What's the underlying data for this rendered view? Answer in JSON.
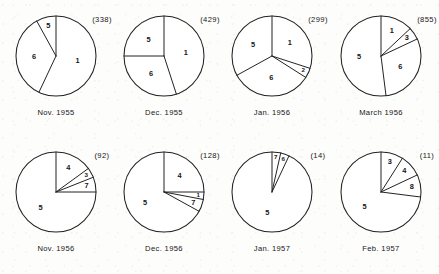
{
  "figure": {
    "name": "monthly-composition-pie-series",
    "background": "#fdfdfc",
    "stroke_color": "#232323",
    "rows": 2,
    "columns": 4
  },
  "chart_data": {
    "type": "pie",
    "title": "",
    "subtitle": "",
    "xlabel": "",
    "ylabel": "",
    "legend_position": "none",
    "grid": false,
    "note": "Eight pie charts; each wedge is annotated with a category number, each pie annotated with a parenthesised total count and a month caption.",
    "charts": [
      {
        "caption": "Nov. 1955",
        "total_label": "(338)",
        "total": 338,
        "categories": [
          "1",
          "5",
          "6"
        ],
        "values": [
          57,
          8,
          35
        ],
        "slices": [
          {
            "label": "1",
            "percent": 57,
            "start_deg": 0,
            "end_deg": 205.2
          },
          {
            "label": "6",
            "percent": 35,
            "start_deg": 205.2,
            "end_deg": 331.2
          },
          {
            "label": "5",
            "percent": 8,
            "start_deg": 331.2,
            "end_deg": 360
          }
        ]
      },
      {
        "caption": "Dec. 1955",
        "total_label": "(429)",
        "total": 429,
        "categories": [
          "1",
          "5",
          "6"
        ],
        "values": [
          45,
          25,
          30
        ],
        "slices": [
          {
            "label": "1",
            "percent": 45,
            "start_deg": 0,
            "end_deg": 162
          },
          {
            "label": "6",
            "percent": 30,
            "start_deg": 162,
            "end_deg": 270
          },
          {
            "label": "5",
            "percent": 25,
            "start_deg": 270,
            "end_deg": 360
          }
        ]
      },
      {
        "caption": "Jan. 1956",
        "total_label": "(299)",
        "total": 299,
        "categories": [
          "1",
          "2",
          "5",
          "6"
        ],
        "values": [
          30,
          4,
          33,
          33
        ],
        "slices": [
          {
            "label": "1",
            "percent": 30,
            "start_deg": 0,
            "end_deg": 108
          },
          {
            "label": "2",
            "percent": 4,
            "start_deg": 108,
            "end_deg": 122.4
          },
          {
            "label": "6",
            "percent": 33,
            "start_deg": 122.4,
            "end_deg": 241.2
          },
          {
            "label": "5",
            "percent": 33,
            "start_deg": 241.2,
            "end_deg": 360
          }
        ]
      },
      {
        "caption": "March 1956",
        "total_label": "(855)",
        "total": 855,
        "categories": [
          "1",
          "3",
          "5",
          "6"
        ],
        "values": [
          13,
          5,
          52,
          30
        ],
        "slices": [
          {
            "label": "1",
            "percent": 13,
            "start_deg": 0,
            "end_deg": 46.8
          },
          {
            "label": "3",
            "percent": 5,
            "start_deg": 46.8,
            "end_deg": 64.8
          },
          {
            "label": "6",
            "percent": 30,
            "start_deg": 64.8,
            "end_deg": 172.8
          },
          {
            "label": "5",
            "percent": 52,
            "start_deg": 172.8,
            "end_deg": 360
          }
        ]
      },
      {
        "caption": "Nov. 1956",
        "total_label": "(92)",
        "total": 92,
        "categories": [
          "3",
          "4",
          "5",
          "7"
        ],
        "values": [
          4,
          15,
          75,
          6
        ],
        "slices": [
          {
            "label": "4",
            "percent": 15,
            "start_deg": 0,
            "end_deg": 54
          },
          {
            "label": "3",
            "percent": 4,
            "start_deg": 54,
            "end_deg": 68.4
          },
          {
            "label": "7",
            "percent": 6,
            "start_deg": 68.4,
            "end_deg": 90
          },
          {
            "label": "5",
            "percent": 75,
            "start_deg": 90,
            "end_deg": 360
          }
        ]
      },
      {
        "caption": "Dec. 1956",
        "total_label": "(128)",
        "total": 128,
        "categories": [
          "1",
          "4",
          "5",
          "7"
        ],
        "values": [
          3,
          25,
          67,
          5
        ],
        "slices": [
          {
            "label": "4",
            "percent": 25,
            "start_deg": 0,
            "end_deg": 90
          },
          {
            "label": "1",
            "percent": 3,
            "start_deg": 90,
            "end_deg": 100.8
          },
          {
            "label": "7",
            "percent": 5,
            "start_deg": 100.8,
            "end_deg": 118.8
          },
          {
            "label": "5",
            "percent": 67,
            "start_deg": 118.8,
            "end_deg": 360
          }
        ]
      },
      {
        "caption": "Jan. 1957",
        "total_label": "(14)",
        "total": 14,
        "categories": [
          "5",
          "6",
          "7"
        ],
        "values": [
          93,
          3.5,
          3.5
        ],
        "slices": [
          {
            "label": "7",
            "percent": 3.5,
            "start_deg": 0,
            "end_deg": 12.6
          },
          {
            "label": "6",
            "percent": 3.5,
            "start_deg": 12.6,
            "end_deg": 25.2
          },
          {
            "label": "5",
            "percent": 93,
            "start_deg": 25.2,
            "end_deg": 360
          }
        ]
      },
      {
        "caption": "Feb. 1957",
        "total_label": "(11)",
        "total": 11,
        "categories": [
          "3",
          "4",
          "5",
          "8"
        ],
        "values": [
          9,
          9,
          73,
          9
        ],
        "slices": [
          {
            "label": "3",
            "percent": 9,
            "start_deg": 0,
            "end_deg": 32.4
          },
          {
            "label": "4",
            "percent": 9,
            "start_deg": 32.4,
            "end_deg": 64.8
          },
          {
            "label": "8",
            "percent": 9,
            "start_deg": 64.8,
            "end_deg": 97.2
          },
          {
            "label": "5",
            "percent": 73,
            "start_deg": 97.2,
            "end_deg": 360
          }
        ]
      }
    ]
  }
}
